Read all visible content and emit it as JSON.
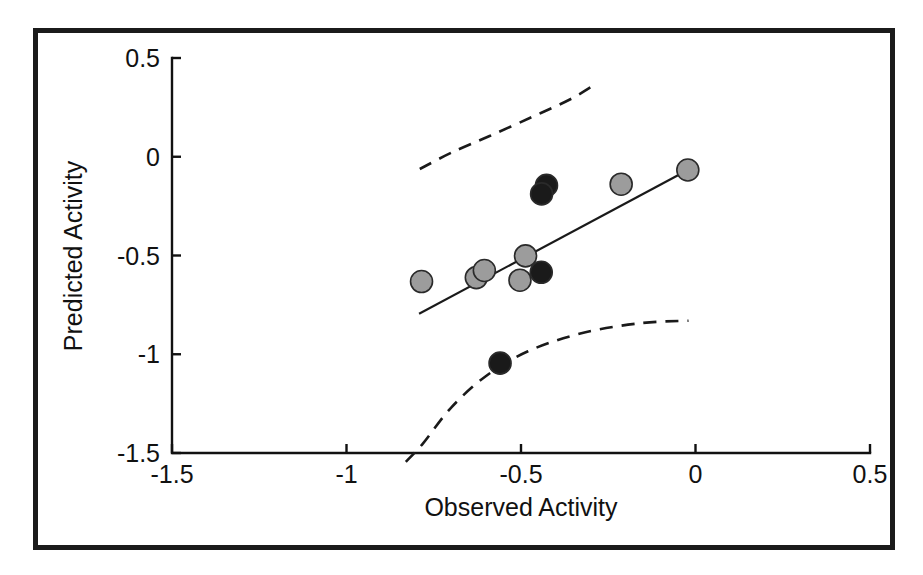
{
  "figure": {
    "background_color": "#ffffff",
    "frame_color": "#1b1b1b",
    "line_color": "#1a1a1a"
  },
  "axis_titles": {
    "x": "Observed Activity",
    "y": "Predicted Activity"
  },
  "chart_data": {
    "type": "scatter",
    "title": "",
    "xlabel": "Observed Activity",
    "ylabel": "Predicted Activity",
    "xlim": [
      -1.5,
      0.5
    ],
    "ylim": [
      -1.5,
      0.5
    ],
    "xticks": [
      -1.5,
      -1,
      -0.5,
      0,
      0.5
    ],
    "xtick_labels": [
      "-1.5",
      "-1",
      "-0.5",
      "0",
      "0.5"
    ],
    "yticks": [
      0.5,
      0,
      -0.5,
      -1,
      -1.5
    ],
    "ytick_labels": [
      "0.5",
      "0",
      "-0.5",
      "-1",
      "-1.5"
    ],
    "grid": false,
    "legend": null,
    "series": [
      {
        "name": "training-set",
        "marker": "circle",
        "fill_color": "#9c9c9c",
        "edge_color": "#2a2a2a",
        "points": [
          {
            "x": -0.785,
            "y": -0.632
          },
          {
            "x": -0.628,
            "y": -0.612
          },
          {
            "x": -0.605,
            "y": -0.576
          },
          {
            "x": -0.487,
            "y": -0.502
          },
          {
            "x": -0.503,
            "y": -0.625
          },
          {
            "x": -0.213,
            "y": -0.139
          },
          {
            "x": -0.022,
            "y": -0.067
          }
        ]
      },
      {
        "name": "test-set",
        "marker": "circle",
        "fill_color": "#1a1a1a",
        "edge_color": "#1a1a1a",
        "points": [
          {
            "x": -0.427,
            "y": -0.145
          },
          {
            "x": -0.441,
            "y": -0.188
          },
          {
            "x": -0.442,
            "y": -0.585
          },
          {
            "x": -0.56,
            "y": -1.045
          }
        ]
      }
    ],
    "fit_line": {
      "name": "regression-line",
      "style": "solid",
      "from": {
        "x": -0.792,
        "y": -0.795
      },
      "to": {
        "x": -0.022,
        "y": -0.067
      }
    },
    "confidence_bands": [
      {
        "name": "upper-confidence-curve",
        "style": "dashed",
        "points": [
          {
            "x": -0.79,
            "y": -0.062
          },
          {
            "x": -0.7,
            "y": 0.02
          },
          {
            "x": -0.59,
            "y": 0.105
          },
          {
            "x": -0.47,
            "y": 0.2
          },
          {
            "x": -0.36,
            "y": 0.29
          },
          {
            "x": -0.293,
            "y": 0.36
          }
        ]
      },
      {
        "name": "lower-confidence-curve",
        "style": "dashed",
        "points": [
          {
            "x": -0.83,
            "y": -1.545
          },
          {
            "x": -0.78,
            "y": -1.45
          },
          {
            "x": -0.7,
            "y": -1.27
          },
          {
            "x": -0.6,
            "y": -1.11
          },
          {
            "x": -0.48,
            "y": -0.985
          },
          {
            "x": -0.33,
            "y": -0.895
          },
          {
            "x": -0.16,
            "y": -0.843
          },
          {
            "x": -0.02,
            "y": -0.83
          }
        ]
      }
    ]
  }
}
